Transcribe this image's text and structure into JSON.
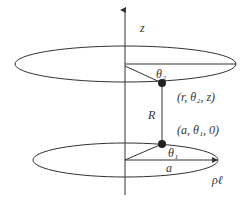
{
  "diagram": {
    "axis_label": "z",
    "upper_point_label": "(r, θ₂, z)",
    "lower_point_label": "(a, θ₁, 0)",
    "distance_label": "R",
    "upper_angle_label": "θ₂",
    "lower_angle_label": "θ₁",
    "radius_label": "a",
    "charge_density_label": "ρℓ",
    "colors": {
      "stroke": "#333333",
      "background": "#ffffff"
    }
  }
}
